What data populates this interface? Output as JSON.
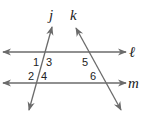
{
  "diagram": {
    "lines": {
      "l": {
        "label": "ℓ",
        "y": 52,
        "x1": 3,
        "x2": 126
      },
      "m": {
        "label": "m",
        "y": 83,
        "x1": 3,
        "x2": 126
      },
      "j": {
        "label": "j",
        "x1": 52,
        "y1": 27,
        "x2": 29,
        "y2": 110
      },
      "k": {
        "label": "k",
        "x1": 76,
        "y1": 28,
        "x2": 121,
        "y2": 110
      }
    },
    "angles": [
      "1",
      "2",
      "3",
      "4",
      "5",
      "6"
    ],
    "colors": {
      "line": "#6b6b6b",
      "text": "#222222"
    }
  }
}
